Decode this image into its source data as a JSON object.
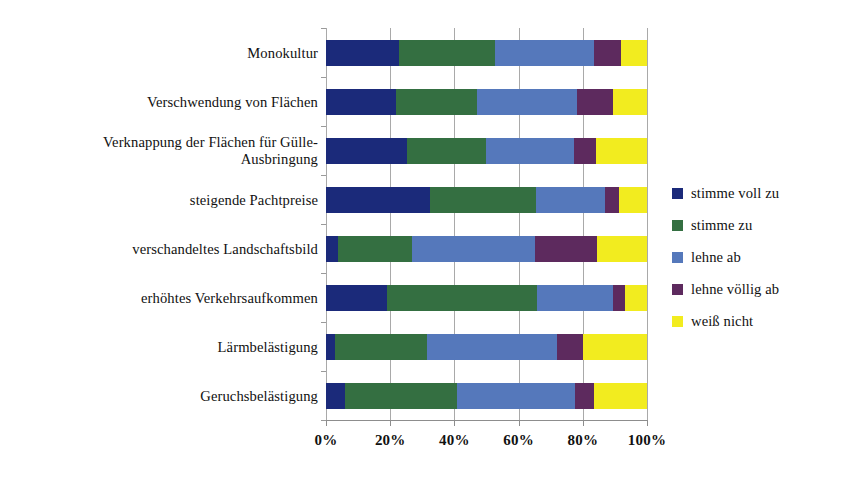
{
  "chart_data": {
    "type": "bar",
    "orientation": "horizontal",
    "stacked": true,
    "stack_mode": "percent",
    "title": "",
    "subtitle": "",
    "xlabel": "",
    "ylabel": "",
    "xlim": [
      0,
      100
    ],
    "xticks": [
      0,
      20,
      40,
      60,
      80,
      100
    ],
    "xticklabels": [
      "0%",
      "20%",
      "40%",
      "60%",
      "80%",
      "100%"
    ],
    "grid": "vertical",
    "legend_position": "right",
    "categories": [
      "Monokultur",
      "Verschwendung von Flächen",
      "Verknappung der Flächen für Gülle-\nAusbringung",
      "steigende Pachtpreise",
      "verschandeltes Landschaftsbild",
      "erhöhtes Verkehrsaufkommen",
      "Lärmbelästigung",
      "Geruchsbelästigung"
    ],
    "series": [
      {
        "name": "stimme voll zu",
        "color": "#1b2a7a",
        "values": [
          22.7,
          21.8,
          25.2,
          32.4,
          3.7,
          19.0,
          2.8,
          5.9
        ]
      },
      {
        "name": "stimme zu",
        "color": "#346f41",
        "values": [
          29.9,
          25.2,
          24.8,
          33.0,
          23.1,
          46.7,
          28.7,
          34.9
        ]
      },
      {
        "name": "lehne ab",
        "color": "#5578bb",
        "values": [
          30.9,
          31.2,
          27.2,
          21.6,
          38.2,
          23.7,
          40.5,
          36.8
        ]
      },
      {
        "name": "lehne völlig ab",
        "color": "#5d2a5e",
        "values": [
          8.5,
          11.2,
          6.8,
          4.3,
          19.4,
          3.7,
          8.0,
          5.9
        ]
      },
      {
        "name": "weiß nicht",
        "color": "#f2ec1f",
        "values": [
          8.0,
          10.6,
          16.0,
          8.7,
          15.6,
          6.9,
          20.0,
          16.5
        ]
      }
    ]
  },
  "axis": {
    "tick_labels": [
      "0%",
      "20%",
      "40%",
      "60%",
      "80%",
      "100%"
    ]
  },
  "legend": {
    "items": [
      {
        "label": "stimme voll zu",
        "color": "#1b2a7a"
      },
      {
        "label": "stimme zu",
        "color": "#346f41"
      },
      {
        "label": "lehne ab",
        "color": "#5578bb"
      },
      {
        "label": "lehne völlig ab",
        "color": "#5d2a5e"
      },
      {
        "label": "weiß nicht",
        "color": "#f2ec1f"
      }
    ]
  }
}
